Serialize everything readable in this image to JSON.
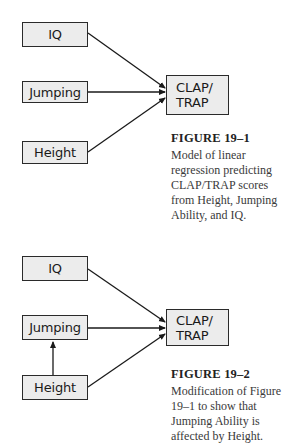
{
  "figures": [
    {
      "nodes": {
        "iq": "IQ",
        "jumping": "Jumping",
        "height": "Height",
        "target_line1": "CLAP/",
        "target_line2": "TRAP"
      },
      "edges": [
        {
          "from": "IQ",
          "to": "CLAP/TRAP"
        },
        {
          "from": "Jumping",
          "to": "CLAP/TRAP"
        },
        {
          "from": "Height",
          "to": "CLAP/TRAP"
        }
      ],
      "caption": {
        "title": "FIGURE 19–1",
        "body": "Model of linear regression predicting CLAP/TRAP scores from Height, Jumping Ability, and IQ."
      }
    },
    {
      "nodes": {
        "iq": "IQ",
        "jumping": "Jumping",
        "height": "Height",
        "target_line1": "CLAP/",
        "target_line2": "TRAP"
      },
      "edges": [
        {
          "from": "IQ",
          "to": "CLAP/TRAP"
        },
        {
          "from": "Jumping",
          "to": "CLAP/TRAP"
        },
        {
          "from": "Height",
          "to": "CLAP/TRAP"
        },
        {
          "from": "Height",
          "to": "Jumping"
        }
      ],
      "caption": {
        "title": "FIGURE 19–2",
        "body": "Modification of Figure 19–1 to show that Jumping Ability is affected by Height."
      }
    }
  ],
  "colors": {
    "node_fill": "#ececec",
    "node_border": "#2a2a2a",
    "arrow": "#1a1a1a"
  }
}
